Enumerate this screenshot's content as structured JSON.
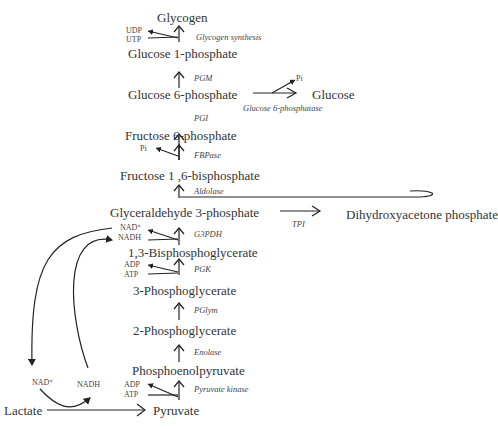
{
  "metabolites": {
    "glycogen": "Glycogen",
    "glucose_1_phosphate": "Glucose 1-phosphate",
    "glucose_6_phosphate": "Glucose 6-phosphate",
    "glucose": "Glucose",
    "fructose_6_phosphate": "Fructose 6-phosphate",
    "fructose_1_6_bisphosphate": "Fructose 1 ,6-bisphosphate",
    "glyceraldehyde_3_phosphate": "Glyceraldehyde 3-phosphate",
    "dihydroxyacetone_phosphate": "Dihydroxyacetone phosphate",
    "bisphosphoglycerate_1_3": "1,3-Bisphosphoglycerate",
    "phosphoglycerate_3": "3-Phosphoglycerate",
    "phosphoglycerate_2": "2-Phosphoglycerate",
    "phosphoenolpyruvate": "Phosphoenolpyruvate",
    "pyruvate": "Pyruvate",
    "lactate": "Lactate"
  },
  "enzymes": {
    "glycogen_synthesis": "Glycogen synthesis",
    "pgm": "PGM",
    "glucose_6_phosphatase": "Glucose 6-phosphatase",
    "pgi": "PGI",
    "fbpase": "FBPase",
    "aldolase": "Aldolase",
    "tpi": "TPI",
    "g3pdh": "G3PDH",
    "pgk": "PGK",
    "pglym": "PGlym",
    "enolase": "Enolase",
    "pyruvate_kinase": "Pyruvate kinase"
  },
  "cofactors": {
    "udp": "UDP",
    "utp": "UTP",
    "pi_glucose": "Pi",
    "pi_fbpase": "Pi",
    "nad_plus_g3pdh": "NAD⁺",
    "nadh_g3pdh": "NADH",
    "adp_pgk": "ADP",
    "atp_pgk": "ATP",
    "adp_pk": "ADP",
    "atp_pk": "ATP",
    "nad_plus_ldh": "NAD⁺",
    "nadh_ldh": "NADH"
  }
}
